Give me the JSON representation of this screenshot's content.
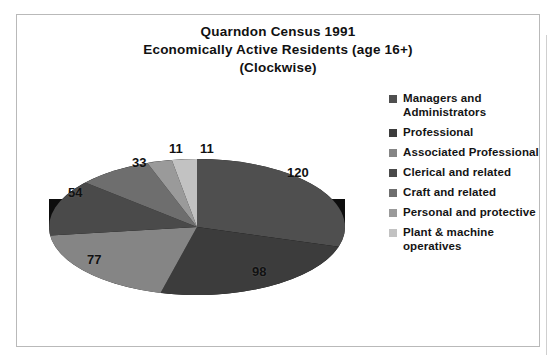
{
  "frame": {
    "border_color": "#b9b9b9",
    "background": "#ffffff"
  },
  "title": {
    "line1": "Quarndon Census 1991",
    "line2": "Economically Active Residents (age 16+)",
    "line3": "(Clockwise)"
  },
  "chart_data": {
    "type": "pie",
    "title": "Quarndon Census 1991 Economically Active Residents (age 16+) (Clockwise)",
    "xlabel": "",
    "ylabel": "",
    "legend_position": "right",
    "grid": false,
    "three_d": true,
    "direction": "clockwise",
    "total": 404,
    "categories": [
      "Managers and Administrators",
      "Professional",
      "Associated Professional",
      "Clerical and related",
      "Craft and related",
      "Personal and protective",
      "Plant & machine operatives"
    ],
    "values": [
      120,
      98,
      77,
      54,
      33,
      11,
      11
    ],
    "labels": [
      "120",
      "98",
      "77",
      "54",
      "33",
      "11",
      "11"
    ],
    "colors": [
      "#4f4f4f",
      "#3c3c3c",
      "#858585",
      "#4a4a4a",
      "#6e6e6e",
      "#9a9a9a",
      "#c2c2c2"
    ],
    "side_color": "#0d0d0d"
  },
  "legend": {
    "items": [
      {
        "label": "Managers and Administrators",
        "color": "#4f4f4f"
      },
      {
        "label": "Professional",
        "color": "#3c3c3c"
      },
      {
        "label": "Associated Professional",
        "color": "#858585"
      },
      {
        "label": "Clerical and related",
        "color": "#4a4a4a"
      },
      {
        "label": "Craft and related",
        "color": "#6e6e6e"
      },
      {
        "label": "Personal and protective",
        "color": "#9a9a9a"
      },
      {
        "label": "Plant & machine operatives",
        "color": "#c2c2c2"
      }
    ]
  },
  "slice_labels": [
    {
      "text": "120",
      "x": 268,
      "y": 78
    },
    {
      "text": "98",
      "x": 233,
      "y": 177
    },
    {
      "text": "77",
      "x": 68,
      "y": 165
    },
    {
      "text": "54",
      "x": 49,
      "y": 98
    },
    {
      "text": "33",
      "x": 113,
      "y": 68
    },
    {
      "text": "11",
      "x": 150,
      "y": 54
    },
    {
      "text": "11",
      "x": 181,
      "y": 54
    }
  ]
}
